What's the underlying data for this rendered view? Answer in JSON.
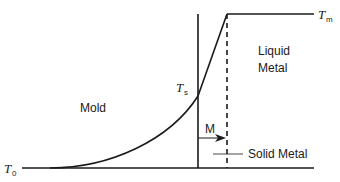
{
  "diagram": {
    "title": "",
    "labels": {
      "mold": "Mold",
      "liquid_line1": "Liquid",
      "liquid_line2": "Metal",
      "solid_metal": "Solid Metal",
      "interface_motion": "M",
      "t_melt_main": "T",
      "t_melt_sub": "m",
      "t_surface_main": "T",
      "t_surface_sub": "s",
      "t_initial_main": "T",
      "t_initial_sub": "0"
    },
    "colors": {
      "line": "#1a1a1a",
      "background": "#ffffff"
    },
    "elements": {
      "mold_wall": "solid vertical line",
      "solidification_front": "dashed vertical line",
      "temperature_profile": "curve rising in mold, linear through solid, flat in liquid"
    }
  }
}
